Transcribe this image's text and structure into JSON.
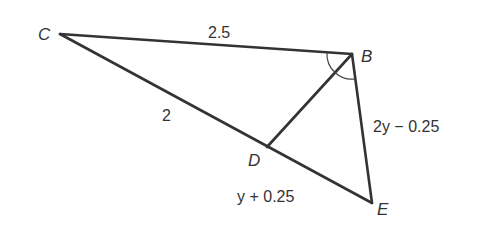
{
  "diagram": {
    "type": "triangle-with-angle-bisector",
    "vertices": {
      "C": {
        "label": "C",
        "x": 60,
        "y": 34
      },
      "B": {
        "label": "B",
        "x": 352,
        "y": 54
      },
      "E": {
        "label": "E",
        "x": 372,
        "y": 203
      },
      "D": {
        "label": "D",
        "x": 267,
        "y": 147
      }
    },
    "segments": [
      {
        "from": "C",
        "to": "B",
        "label": "2.5"
      },
      {
        "from": "C",
        "to": "D",
        "label": "2"
      },
      {
        "from": "D",
        "to": "E",
        "label": "y + 0.25"
      },
      {
        "from": "B",
        "to": "E",
        "label": "2y − 0.25"
      },
      {
        "from": "B",
        "to": "D",
        "label": ""
      }
    ],
    "angle_marks": {
      "vertex": "B",
      "description": "two equal angle arcs: ∠CBD = ∠DBE (BD bisects angle CBE)"
    },
    "labels": {
      "C": "C",
      "B": "B",
      "D": "D",
      "E": "E",
      "CB": "2.5",
      "CD": "2",
      "DE": "y + 0.25",
      "BE": "2y − 0.25"
    }
  }
}
